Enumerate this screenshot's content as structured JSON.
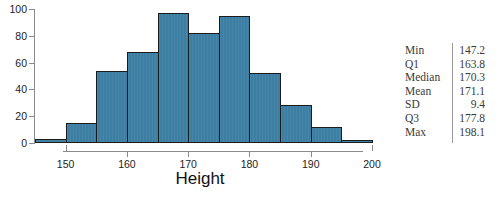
{
  "chart_data": {
    "type": "bar",
    "title": "",
    "subtitle": "",
    "xlabel": "Height",
    "ylabel": "",
    "grid": false,
    "legend": "none",
    "bar_fill_color": "#3d7fa3",
    "bar_edge_color": "#1b1b1b",
    "axis_color": "#8a8a8a",
    "xlim": [
      145,
      200
    ],
    "ylim": [
      0,
      100
    ],
    "bin_width": 5,
    "categories": [
      "145-150",
      "150-155",
      "155-160",
      "160-165",
      "165-170",
      "170-175",
      "175-180",
      "180-185",
      "185-190",
      "190-195",
      "195-200"
    ],
    "bin_edges": [
      145,
      150,
      155,
      160,
      165,
      170,
      175,
      180,
      185,
      190,
      195,
      200
    ],
    "values": [
      3,
      15,
      54,
      68,
      97,
      82,
      95,
      52,
      28,
      12,
      2
    ],
    "xticks": [
      150,
      160,
      170,
      180,
      190,
      200
    ],
    "xtick_labels": [
      "150",
      "160",
      "170",
      "180",
      "190",
      "200"
    ],
    "yticks": [
      0,
      20,
      40,
      60,
      80,
      100
    ],
    "ytick_labels": [
      "0",
      "20",
      "40",
      "60",
      "80",
      "100"
    ]
  },
  "stats": {
    "rows": [
      {
        "label": "Min",
        "value": "147.2"
      },
      {
        "label": "Q1",
        "value": "163.8"
      },
      {
        "label": "Median",
        "value": "170.3"
      },
      {
        "label": "Mean",
        "value": "171.1"
      },
      {
        "label": "SD",
        "value": "9.4"
      },
      {
        "label": "Q3",
        "value": "177.8"
      },
      {
        "label": "Max",
        "value": "198.1"
      }
    ]
  }
}
